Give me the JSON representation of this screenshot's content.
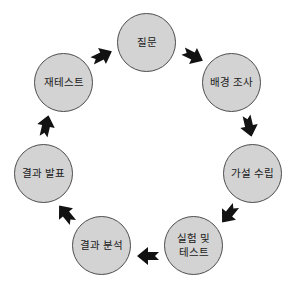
{
  "diagram": {
    "type": "cycle",
    "direction": "clockwise",
    "node_shape": "circle"
  },
  "nodes": [
    {
      "id": "question",
      "label": "질문"
    },
    {
      "id": "background-research",
      "label": "배경 조사"
    },
    {
      "id": "form-hypothesis",
      "label": "가설 수립"
    },
    {
      "id": "experiment-and-test",
      "label": "실험 및\n테스트"
    },
    {
      "id": "analyze-results",
      "label": "결과 분석"
    },
    {
      "id": "report-results",
      "label": "결과 발표"
    },
    {
      "id": "retest",
      "label": "재테스트"
    }
  ],
  "arrows": [
    {
      "from": "질문",
      "to": "배경 조사",
      "direction": "down-right"
    },
    {
      "from": "배경 조사",
      "to": "가설 수립",
      "direction": "down"
    },
    {
      "from": "가설 수립",
      "to": "실험 및 테스트",
      "direction": "down-left"
    },
    {
      "from": "실험 및 테스트",
      "to": "결과 분석",
      "direction": "left"
    },
    {
      "from": "결과 분석",
      "to": "결과 발표",
      "direction": "up-left"
    },
    {
      "from": "결과 발표",
      "to": "재테스트",
      "direction": "up"
    },
    {
      "from": "재테스트",
      "to": "질문",
      "direction": "right"
    }
  ],
  "colors": {
    "background": "#ffffff",
    "node_fill": "#d3d3d3",
    "node_border": "#4d4d4d",
    "arrow": "#121212",
    "text": "#1a1a1a"
  }
}
